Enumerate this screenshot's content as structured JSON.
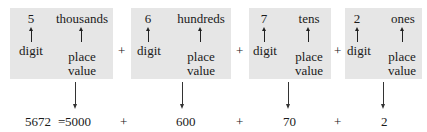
{
  "boxes": [
    {
      "digit": "5",
      "place": "thousands",
      "digit_label": "digit",
      "place_label_1": "place",
      "place_label_2": "value"
    },
    {
      "digit": "6",
      "place": "hundreds",
      "digit_label": "digit",
      "place_label_1": "place",
      "place_label_2": "value"
    },
    {
      "digit": "7",
      "place": "tens",
      "digit_label": "digit",
      "place_label_1": "place",
      "place_label_2": "value"
    },
    {
      "digit": "2",
      "place": "ones",
      "digit_label": "digit",
      "place_label_1": "place",
      "place_label_2": "value"
    }
  ],
  "operators": {
    "plus": "+",
    "equals": "="
  },
  "expansion": {
    "number": "5672",
    "terms": [
      "5000",
      "600",
      "70",
      "2"
    ]
  },
  "colors": {
    "box_bg": "#e6e6e6",
    "text": "#1a1a1a"
  }
}
